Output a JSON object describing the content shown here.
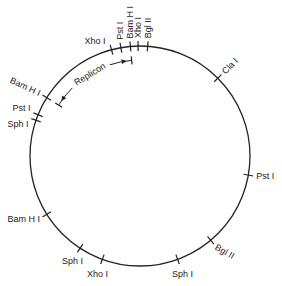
{
  "plasmid_map": {
    "sites": [
      {
        "name": "Xho I",
        "position_deg": 345
      },
      {
        "name": "Pst I",
        "position_deg": 350
      },
      {
        "name": "Bam H I",
        "position_deg": 355
      },
      {
        "name": "Xho I",
        "position_deg": 359
      },
      {
        "name": "Bgl II",
        "position_deg": 4
      },
      {
        "name": "Cla I",
        "position_deg": 45
      },
      {
        "name": "Pst I",
        "position_deg": 100
      },
      {
        "name": "Bgl II",
        "position_deg": 140
      },
      {
        "name": "Sph I",
        "position_deg": 160
      },
      {
        "name": "Xho I",
        "position_deg": 200
      },
      {
        "name": "Sph I",
        "position_deg": 213
      },
      {
        "name": "Bam H I",
        "position_deg": 238
      },
      {
        "name": "Sph I",
        "position_deg": 289
      },
      {
        "name": "Pst I",
        "position_deg": 292
      },
      {
        "name": "Bam H I",
        "position_deg": 302
      }
    ],
    "replicon": {
      "label": "Replicon",
      "start_deg": 302,
      "end_deg": 355
    }
  }
}
